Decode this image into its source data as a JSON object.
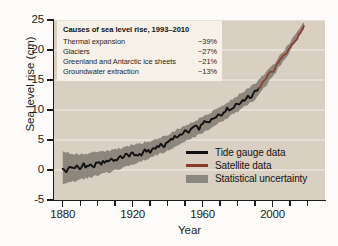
{
  "chart_data": {
    "type": "line",
    "title": "",
    "xlabel": "Year",
    "ylabel": "Sea level rise (cm)",
    "xlim": [
      1875,
      2030
    ],
    "ylim": [
      -5,
      25
    ],
    "xticks": [
      1880,
      1890,
      1900,
      1910,
      1920,
      1930,
      1940,
      1950,
      1960,
      1970,
      1980,
      1990,
      2000,
      2010,
      2020
    ],
    "xtick_labels": [
      "1880",
      "",
      "",
      "",
      "1920",
      "",
      "",
      "",
      "1960",
      "",
      "",
      "",
      "2000",
      "",
      ""
    ],
    "yticks": [
      -5,
      0,
      5,
      10,
      15,
      20,
      25
    ],
    "ytick_labels": [
      "-5",
      "0",
      "5",
      "10",
      "15",
      "20",
      "25"
    ],
    "grid": "horizontal",
    "legend_position": "inside-bottom-right",
    "series": [
      {
        "name": "Tide gauge data",
        "color": "#111111",
        "type": "line",
        "x": [
          1880,
          1882,
          1884,
          1886,
          1888,
          1890,
          1892,
          1894,
          1896,
          1898,
          1900,
          1902,
          1904,
          1906,
          1908,
          1910,
          1912,
          1914,
          1916,
          1918,
          1920,
          1922,
          1924,
          1926,
          1928,
          1930,
          1932,
          1934,
          1936,
          1938,
          1940,
          1942,
          1944,
          1946,
          1948,
          1950,
          1952,
          1954,
          1956,
          1958,
          1960,
          1962,
          1964,
          1966,
          1968,
          1970,
          1972,
          1974,
          1976,
          1978,
          1980,
          1982,
          1984,
          1986,
          1988,
          1990,
          1992
        ],
        "y": [
          0.3,
          -0.2,
          0.6,
          0.1,
          0.9,
          0.4,
          1.0,
          0.5,
          1.1,
          0.7,
          1.3,
          0.9,
          1.5,
          1.2,
          1.8,
          1.6,
          2.2,
          2.0,
          2.5,
          2.3,
          2.8,
          2.5,
          2.4,
          3.0,
          3.3,
          3.1,
          3.6,
          3.9,
          4.3,
          4.1,
          4.8,
          5.2,
          5.5,
          5.3,
          6.1,
          6.4,
          6.2,
          6.9,
          7.3,
          7.0,
          7.7,
          8.2,
          8.0,
          8.6,
          9.1,
          8.9,
          9.6,
          10.1,
          9.9,
          10.6,
          11.2,
          11.0,
          11.8,
          12.4,
          12.2,
          13.0,
          13.6
        ]
      },
      {
        "name": "Satellite data",
        "color": "#8c3a28",
        "type": "line",
        "x": [
          1992,
          1994,
          1996,
          1998,
          2000,
          2002,
          2004,
          2006,
          2008,
          2010,
          2012,
          2014,
          2016,
          2018
        ],
        "y": [
          13.6,
          14.4,
          15.1,
          16.0,
          16.4,
          17.3,
          18.1,
          18.8,
          19.6,
          20.5,
          21.1,
          22.0,
          22.9,
          24.0
        ]
      }
    ],
    "uncertainty": {
      "name": "Statistical uncertainty",
      "color": "#5d5852",
      "x": [
        1880,
        1890,
        1900,
        1910,
        1920,
        1930,
        1940,
        1950,
        1960,
        1970,
        1980,
        1990,
        2000,
        2010,
        2018
      ],
      "lower": [
        -2.4,
        -1.6,
        -0.9,
        -0.1,
        1.0,
        2.0,
        3.2,
        4.8,
        6.2,
        7.9,
        9.8,
        11.8,
        15.5,
        19.8,
        23.4
      ],
      "upper": [
        3.0,
        2.6,
        3.0,
        3.4,
        4.2,
        4.8,
        5.8,
        7.4,
        8.8,
        10.5,
        12.4,
        14.4,
        17.4,
        21.3,
        24.6
      ]
    }
  },
  "axes": {
    "y_title": "Sea level rise (cm)",
    "x_title": "Year",
    "y_labels": [
      "25",
      "20",
      "15",
      "10",
      "5",
      "0",
      "-5"
    ],
    "x_labels": [
      "1880",
      "1920",
      "1960",
      "2000"
    ]
  },
  "inset": {
    "title": "Causes of sea level rise, 1993–2010",
    "rows": [
      {
        "cause": "Thermal expansion",
        "value": "~39%"
      },
      {
        "cause": "Glaciers",
        "value": "~27%"
      },
      {
        "cause": "Greenland and Antarctic ice sheets",
        "value": "~21%"
      },
      {
        "cause": "Groundwater extraction",
        "value": "~13%"
      }
    ]
  },
  "legend": {
    "items": [
      {
        "label": "Tide gauge data",
        "color": "#111111",
        "kind": "line"
      },
      {
        "label": "Satellite data",
        "color": "#8c3a28",
        "kind": "line"
      },
      {
        "label": "Statistical uncertainty",
        "color": "#8b8781",
        "kind": "band"
      }
    ]
  },
  "colors": {
    "plot_background": "#d9cfc2",
    "gridline": "#f3efe8",
    "inset_background": "#f6f1e9",
    "axis": "#1c1c1c",
    "tide_gauge": "#111111",
    "satellite": "#8c3a28",
    "uncertainty": "#5d5852"
  }
}
